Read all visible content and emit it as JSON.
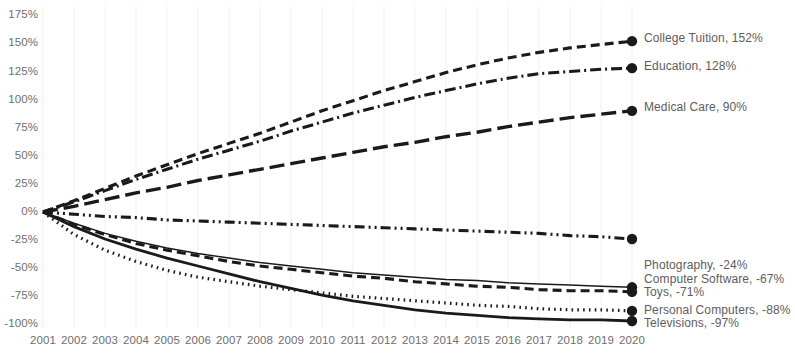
{
  "chart_data": {
    "type": "line",
    "title": "",
    "xlabel": "",
    "ylabel": "",
    "grid": "vertical-only-faint",
    "legend_position": "right-inline-end-labels",
    "xlim": [
      2001,
      2020
    ],
    "ylim": [
      -100,
      175
    ],
    "y_ticks": [
      "175%",
      "150%",
      "125%",
      "100%",
      "75%",
      "50%",
      "25%",
      "0%",
      "-25%",
      "-50%",
      "-75%",
      "-100%"
    ],
    "y_tick_values": [
      175,
      150,
      125,
      100,
      75,
      50,
      25,
      0,
      -25,
      -50,
      -75,
      -100
    ],
    "categories": [
      "2001",
      "2002",
      "2003",
      "2004",
      "2005",
      "2006",
      "2007",
      "2008",
      "2009",
      "2010",
      "2011",
      "2012",
      "2013",
      "2014",
      "2015",
      "2016",
      "2017",
      "2018",
      "2019",
      "2020"
    ],
    "series": [
      {
        "name": "College Tuition",
        "end_value": 152,
        "label": "College Tuition, 152%",
        "dash": "dashed",
        "color": "#1a1a1a",
        "values": [
          0,
          10,
          21,
          32,
          42,
          52,
          61,
          70,
          80,
          90,
          99,
          108,
          116,
          124,
          131,
          137,
          142,
          146,
          149,
          152
        ]
      },
      {
        "name": "Education",
        "end_value": 128,
        "label": "Education, 128%",
        "dash": "dash-dot",
        "color": "#1a1a1a",
        "values": [
          0,
          9,
          19,
          29,
          38,
          47,
          55,
          63,
          72,
          80,
          88,
          95,
          102,
          108,
          114,
          119,
          123,
          125,
          127,
          128
        ]
      },
      {
        "name": "Medical Care",
        "end_value": 90,
        "label": "Medical Care, 90%",
        "dash": "long-dash",
        "color": "#1a1a1a",
        "values": [
          0,
          5,
          11,
          17,
          22,
          28,
          33,
          38,
          43,
          48,
          53,
          58,
          62,
          67,
          71,
          76,
          80,
          84,
          87,
          90
        ]
      },
      {
        "name": "Photography",
        "end_value": -24,
        "label": "Photography, -24%",
        "dash": "dash-dot-dot",
        "color": "#1a1a1a",
        "values": [
          0,
          -2,
          -4,
          -5,
          -7,
          -8,
          -9,
          -10,
          -11,
          -12,
          -13,
          -14,
          -15,
          -16,
          -17,
          -18,
          -19,
          -21,
          -22,
          -24
        ]
      },
      {
        "name": "Computer Software",
        "end_value": -67,
        "label": "Computer Software, -67%",
        "dash": "thin-solid",
        "color": "#1a1a1a",
        "values": [
          0,
          -10,
          -19,
          -26,
          -32,
          -37,
          -41,
          -45,
          -48,
          -51,
          -54,
          -56,
          -58,
          -60,
          -61,
          -63,
          -64,
          -65,
          -66,
          -67
        ]
      },
      {
        "name": "Toys",
        "end_value": -71,
        "label": "Toys, -71%",
        "dash": "dashed",
        "color": "#1a1a1a",
        "values": [
          0,
          -11,
          -20,
          -28,
          -34,
          -39,
          -44,
          -48,
          -51,
          -54,
          -57,
          -59,
          -62,
          -64,
          -66,
          -67,
          -69,
          -70,
          -70,
          -71
        ]
      },
      {
        "name": "Personal Computers",
        "end_value": -88,
        "label": "Personal Computers, -88%",
        "dash": "dotted",
        "color": "#1a1a1a",
        "values": [
          0,
          -20,
          -34,
          -44,
          -52,
          -58,
          -62,
          -66,
          -69,
          -72,
          -75,
          -77,
          -79,
          -81,
          -83,
          -84,
          -86,
          -87,
          -87,
          -88
        ]
      },
      {
        "name": "Televisions",
        "end_value": -97,
        "label": "Televisions, -97%",
        "dash": "solid",
        "color": "#1a1a1a",
        "values": [
          0,
          -13,
          -24,
          -33,
          -41,
          -48,
          -55,
          -62,
          -68,
          -74,
          -79,
          -83,
          -87,
          -90,
          -92,
          -94,
          -95,
          -96,
          -96,
          -97
        ]
      }
    ]
  },
  "axis": {
    "y_tick_0": "175%",
    "y_tick_1": "150%",
    "y_tick_2": "125%",
    "y_tick_3": "100%",
    "y_tick_4": "75%",
    "y_tick_5": "50%",
    "y_tick_6": "25%",
    "y_tick_7": "0%",
    "y_tick_8": "-25%",
    "y_tick_9": "-50%",
    "y_tick_10": "75%",
    "y_tick_11": "-100%"
  }
}
